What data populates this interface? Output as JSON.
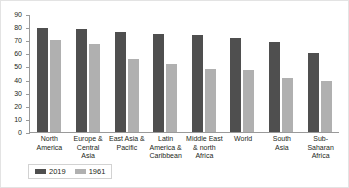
{
  "chart_data": {
    "type": "bar",
    "title": "",
    "subtitle": "",
    "xlabel": "",
    "ylabel": "",
    "ylim": [
      0,
      90
    ],
    "ytick_step": 10,
    "yticks": [
      "90",
      "80",
      "70",
      "60",
      "50",
      "40",
      "30",
      "20",
      "10",
      "0"
    ],
    "grid": false,
    "legend_position": "bottom-left",
    "categories": [
      "North America",
      "Europe & Central Asia",
      "East Asia & Pacific",
      "Latin America & Caribbean",
      "Middle East & north Africa",
      "World",
      "South Asia",
      "Sub-Saharan Africa"
    ],
    "category_lines": [
      [
        "North",
        "America"
      ],
      [
        "Europe &",
        "Central Asia"
      ],
      [
        "East Asia &",
        "Pacific"
      ],
      [
        "Latin",
        "America &",
        "Caribbean"
      ],
      [
        "Middle East",
        "& north",
        "Africa"
      ],
      [
        "World"
      ],
      [
        "South",
        "Asia"
      ],
      [
        "Sub-",
        "Saharan",
        "Africa"
      ]
    ],
    "series": [
      {
        "name": "2019",
        "color": "#4f4f4f",
        "values": [
          79.5,
          78.5,
          76,
          75,
          74,
          71.5,
          69,
          60
        ]
      },
      {
        "name": "1961",
        "color": "#b0b0b0",
        "values": [
          70,
          67,
          55.5,
          52,
          48,
          47,
          41.5,
          39
        ]
      }
    ]
  },
  "legend": {
    "items": [
      {
        "label": "2019"
      },
      {
        "label": "1961"
      }
    ]
  }
}
